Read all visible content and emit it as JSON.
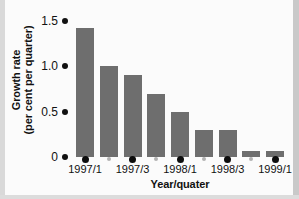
{
  "chart_data": {
    "type": "bar",
    "title": "",
    "xlabel": "Year/quater",
    "ylabel": "Growth rate (per cent per quarter)",
    "ylabel_lines": [
      "Growth rate",
      "(per cent per quarter)"
    ],
    "categories": [
      "1997/1",
      "1997/2",
      "1997/3",
      "1997/4",
      "1998/1",
      "1998/2",
      "1998/3",
      "1998/4",
      "1999/1"
    ],
    "values": [
      1.42,
      1.0,
      0.9,
      0.7,
      0.5,
      0.3,
      0.3,
      0.07,
      0.07
    ],
    "ylim": [
      0,
      1.5
    ],
    "yticks": [
      1.5,
      1.0,
      0.5,
      0
    ],
    "ytick_labels": [
      "1.5",
      "1.0",
      "0.5",
      "0"
    ],
    "xtick_labels_shown": [
      "1997/1",
      "",
      "1997/3",
      "",
      "1998/1",
      "",
      "1998/3",
      "",
      "1999/1"
    ],
    "xtick_major": [
      true,
      false,
      true,
      false,
      true,
      false,
      true,
      false,
      true
    ],
    "grid": false,
    "legend": false,
    "bar_color": "#6e6e6e",
    "axis_color": "#111111",
    "background_color": "#fbfbfb"
  }
}
